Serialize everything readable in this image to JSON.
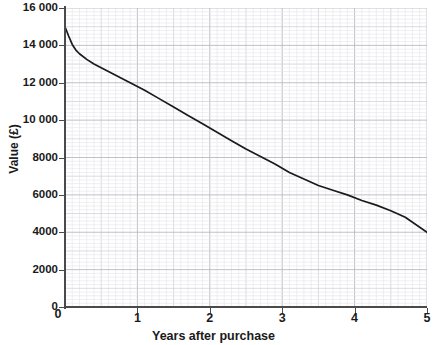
{
  "chart_data": {
    "type": "line",
    "title": "",
    "xlabel": "Years after purchase",
    "ylabel": "Value (£)",
    "xlim": [
      0,
      5
    ],
    "ylim": [
      0,
      16000
    ],
    "grid": true,
    "legend": "none",
    "x_ticks": [
      "0",
      "1",
      "2",
      "3",
      "4",
      "5"
    ],
    "x_tick_values": [
      0,
      1,
      2,
      3,
      4,
      5
    ],
    "y_ticks": [
      "0",
      "2000",
      "4000",
      "6000",
      "8000",
      "10 000",
      "12 000",
      "14 000",
      "16 000"
    ],
    "y_tick_values": [
      0,
      2000,
      4000,
      6000,
      8000,
      10000,
      12000,
      14000,
      16000
    ],
    "series": [
      {
        "name": "Value of purchase",
        "x": [
          0.0,
          0.05,
          0.1,
          0.15,
          0.2,
          0.3,
          0.4,
          0.5,
          0.7,
          0.9,
          1.1,
          1.3,
          1.5,
          1.7,
          1.9,
          2.1,
          2.3,
          2.5,
          2.7,
          2.9,
          3.1,
          3.3,
          3.5,
          3.7,
          3.9,
          4.1,
          4.3,
          4.5,
          4.7,
          5.0
        ],
        "values": [
          15000,
          14500,
          14050,
          13750,
          13550,
          13250,
          13000,
          12800,
          12400,
          12000,
          11600,
          11150,
          10700,
          10250,
          9800,
          9350,
          8900,
          8450,
          8050,
          7650,
          7200,
          6850,
          6500,
          6250,
          6000,
          5700,
          5450,
          5150,
          4800,
          4000
        ]
      }
    ]
  },
  "axis": {
    "y_title": "Value (£)",
    "x_title": "Years after purchase"
  },
  "style": {
    "curve_color": "#1a1a1a",
    "axis_color": "#4a4a4a",
    "major_grid_color": "#b9b9c4",
    "minor_grid_color": "#e4e4ea",
    "background": "#ffffff"
  }
}
